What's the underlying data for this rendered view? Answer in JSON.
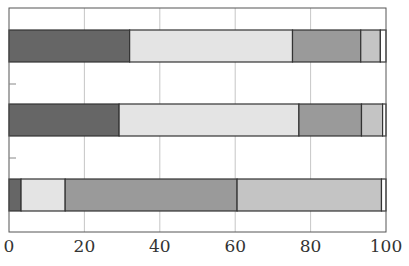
{
  "chart_data": {
    "type": "bar",
    "orientation": "horizontal",
    "stacked": true,
    "title": "",
    "xlabel": "",
    "ylabel": "",
    "xlim": [
      0,
      100
    ],
    "xticks": [
      0,
      20,
      40,
      60,
      80,
      100
    ],
    "xtick_labels": [
      "0",
      "20",
      "40",
      "60",
      "80",
      "100"
    ],
    "grid": "vertical",
    "legend": null,
    "categories": [
      "Bar 1 (top)",
      "Bar 2 (middle)",
      "Bar 3 (bottom)"
    ],
    "series": [
      {
        "name": "Segment 1",
        "color": "#666666",
        "values": [
          32.0,
          29.2,
          3.2
        ]
      },
      {
        "name": "Segment 2",
        "color": "#e4e4e4",
        "values": [
          43.2,
          47.7,
          11.7
        ]
      },
      {
        "name": "Segment 3",
        "color": "#9a9a9a",
        "values": [
          18.1,
          16.6,
          45.6
        ]
      },
      {
        "name": "Segment 4",
        "color": "#c4c4c4",
        "values": [
          5.2,
          5.6,
          38.3
        ]
      },
      {
        "name": "Segment 5",
        "color": "#ffffff",
        "values": [
          1.5,
          0.9,
          1.2
        ]
      }
    ]
  },
  "layout": {
    "plot_left": 9,
    "plot_right": 386,
    "plot_top": 8,
    "plot_bottom": 232,
    "bar_tops": [
      30,
      104,
      179
    ],
    "bar_height": 32,
    "ytick_positions": [
      84,
      158
    ]
  }
}
